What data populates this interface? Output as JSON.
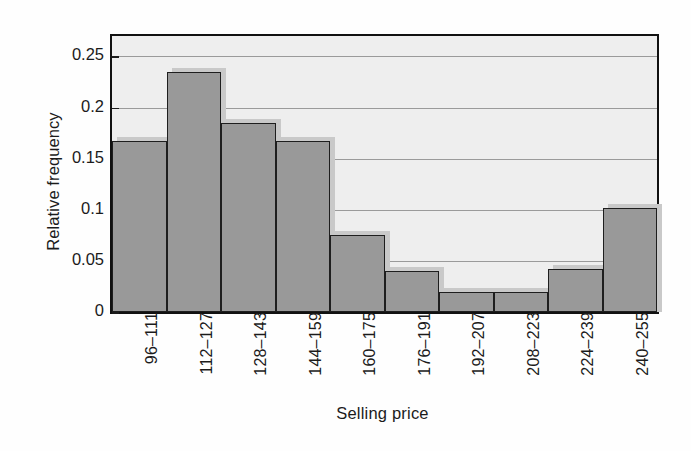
{
  "chart_data": {
    "type": "bar",
    "title": "",
    "subtitle": "",
    "xlabel": "Selling price",
    "ylabel": "Relative frequency",
    "categories": [
      "96–111",
      "112–127",
      "128–143",
      "144–159",
      "160–175",
      "176–191",
      "192–207",
      "208–223",
      "224–239",
      "240–255"
    ],
    "values": [
      0.167,
      0.235,
      0.185,
      0.167,
      0.075,
      0.04,
      0.02,
      0.02,
      0.042,
      0.102
    ],
    "ylim": [
      0,
      0.27
    ],
    "xlim": [
      0,
      10
    ],
    "yticks": [
      0,
      0.05,
      0.1,
      0.15,
      0.2,
      0.25
    ],
    "ytick_labels": [
      "0",
      "0.05",
      "0.1",
      "0.15",
      "0.2",
      "0.25"
    ],
    "grid": "horizontal",
    "legend": "none",
    "bar_fill_color": "#999999",
    "bar_edge_color": "#1e1e1e",
    "plot_background_color": "#eeeeee",
    "gridline_color": "#9a9a9a",
    "frame_color": "#111111",
    "text_color": "#1b1b1b"
  },
  "axes": {
    "y_title": "Relative frequency",
    "x_title": "Selling price"
  }
}
